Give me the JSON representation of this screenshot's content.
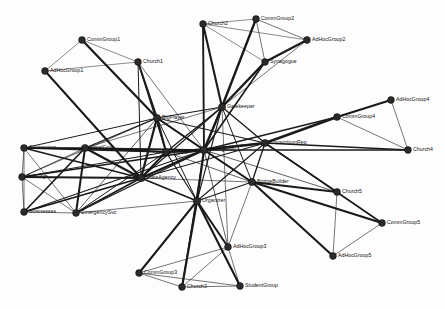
{
  "figure": {
    "width": 445,
    "height": 309,
    "background_color": "#fdfdfd",
    "node_color": "#2b2b2b",
    "edge_color": "#1a1a1a",
    "label_color": "#111111"
  },
  "chart_data": {
    "type": "network",
    "xlabel": "",
    "ylabel": "",
    "grid": false,
    "legend": "none",
    "directed": false,
    "node_count": 28,
    "edge_count": 96,
    "nodes": [
      {
        "id": "CommGroup1",
        "label": "CommGroup1",
        "x": 82,
        "y": 40,
        "r": 3.4,
        "label_dx": 5,
        "label_dy": 0
      },
      {
        "id": "AdHocGroup1",
        "label": "AdHocGroup1",
        "x": 45,
        "y": 71,
        "r": 3.4,
        "label_dx": 5,
        "label_dy": 0
      },
      {
        "id": "Church1",
        "label": "Church1",
        "x": 138,
        "y": 62,
        "r": 3.4,
        "label_dx": 5,
        "label_dy": 0
      },
      {
        "id": "Church2",
        "label": "Church2",
        "x": 203,
        "y": 24,
        "r": 3.4,
        "label_dx": 5,
        "label_dy": 0
      },
      {
        "id": "CommGroup2",
        "label": "CommGroup2",
        "x": 256,
        "y": 19,
        "r": 3.4,
        "label_dx": 5,
        "label_dy": 0
      },
      {
        "id": "AdHocGroup2",
        "label": "AdHocGroup2",
        "x": 307,
        "y": 40,
        "r": 3.4,
        "label_dx": 5,
        "label_dy": 0
      },
      {
        "id": "Synagogue",
        "label": "Synagogue",
        "x": 265,
        "y": 62,
        "r": 3.4,
        "label_dx": 5,
        "label_dy": 0
      },
      {
        "id": "Gatekeeper",
        "label": "Gatekeeper",
        "x": 222,
        "y": 107,
        "r": 3.6,
        "label_dx": 5,
        "label_dy": 0
      },
      {
        "id": "BigPlayer",
        "label": "BigPlayer",
        "x": 157,
        "y": 118,
        "r": 3.6,
        "label_dx": 5,
        "label_dy": 0
      },
      {
        "id": "AdHocGroup4",
        "label": "AdHocGroup4",
        "x": 391,
        "y": 100,
        "r": 3.4,
        "label_dx": 5,
        "label_dy": 0
      },
      {
        "id": "CommGroup4",
        "label": "CommGroup4",
        "x": 337,
        "y": 117,
        "r": 3.4,
        "label_dx": 5,
        "label_dy": 0
      },
      {
        "id": "ConsortiumRep",
        "label": "ConsortiumRep",
        "x": 265,
        "y": 143,
        "r": 3.6,
        "label_dx": 5,
        "label_dy": 0
      },
      {
        "id": "Church4",
        "label": "Church4",
        "x": 408,
        "y": 150,
        "r": 3.4,
        "label_dx": 5,
        "label_dy": 0
      },
      {
        "id": "FedAgency",
        "label": "FedAgency",
        "x": 204,
        "y": 150,
        "r": 3.8,
        "label_dx": 5,
        "label_dy": 0
      },
      {
        "id": "Military",
        "label": "Military",
        "x": 166,
        "y": 152,
        "r": 3.6,
        "label_dx": 5,
        "label_dy": 0
      },
      {
        "id": "Contractors",
        "label": "Contractors",
        "x": 24,
        "y": 148,
        "r": 3.4,
        "label_dx": 5,
        "label_dy": 0
      },
      {
        "id": "LocalGovt",
        "label": "LocalGovt",
        "x": 85,
        "y": 148,
        "r": 3.6,
        "label_dx": 5,
        "label_dy": 0
      },
      {
        "id": "PubOrgs",
        "label": "PubOrgs",
        "x": 22,
        "y": 177,
        "r": 3.4,
        "label_dx": 5,
        "label_dy": 0
      },
      {
        "id": "StateAgency",
        "label": "StateAgency",
        "x": 141,
        "y": 178,
        "r": 3.8,
        "label_dx": 5,
        "label_dy": 0
      },
      {
        "id": "BridgeBuilder",
        "label": "BridgeBuilder",
        "x": 252,
        "y": 182,
        "r": 3.6,
        "label_dx": 5,
        "label_dy": 0
      },
      {
        "id": "Church5",
        "label": "Church5",
        "x": 337,
        "y": 192,
        "r": 3.4,
        "label_dx": 5,
        "label_dy": 0
      },
      {
        "id": "Businesses",
        "label": "Businesses",
        "x": 24,
        "y": 212,
        "r": 3.4,
        "label_dx": 5,
        "label_dy": 0
      },
      {
        "id": "EmergencySvc",
        "label": "EmergencySvc",
        "x": 76,
        "y": 213,
        "r": 3.4,
        "label_dx": 5,
        "label_dy": 0
      },
      {
        "id": "Organizer",
        "label": "Organizer",
        "x": 197,
        "y": 201,
        "r": 3.8,
        "label_dx": 5,
        "label_dy": 0
      },
      {
        "id": "CommGroup5",
        "label": "CommGroup5",
        "x": 382,
        "y": 223,
        "r": 3.4,
        "label_dx": 5,
        "label_dy": 0
      },
      {
        "id": "AdHocGroup3",
        "label": "AdHocGroup3",
        "x": 228,
        "y": 247,
        "r": 3.4,
        "label_dx": 5,
        "label_dy": 0
      },
      {
        "id": "AdHocGroup5",
        "label": "AdHocGroup5",
        "x": 333,
        "y": 256,
        "r": 3.4,
        "label_dx": 5,
        "label_dy": 0
      },
      {
        "id": "CommGroup3",
        "label": "CommGroup3",
        "x": 139,
        "y": 273,
        "r": 3.4,
        "label_dx": 5,
        "label_dy": 0
      },
      {
        "id": "Church3",
        "label": "Church3",
        "x": 182,
        "y": 287,
        "r": 3.4,
        "label_dx": 5,
        "label_dy": 0
      },
      {
        "id": "StudentGroup",
        "label": "StudentGroup",
        "x": 240,
        "y": 286,
        "r": 3.4,
        "label_dx": 5,
        "label_dy": 0
      }
    ],
    "edges": [
      {
        "source": "CommGroup1",
        "target": "AdHocGroup1",
        "weight": 0.5
      },
      {
        "source": "CommGroup1",
        "target": "Church1",
        "weight": 0.5
      },
      {
        "source": "CommGroup1",
        "target": "BigPlayer",
        "weight": 2.2
      },
      {
        "source": "AdHocGroup1",
        "target": "Church1",
        "weight": 0.5
      },
      {
        "source": "AdHocGroup1",
        "target": "StateAgency",
        "weight": 2.0
      },
      {
        "source": "Church1",
        "target": "BigPlayer",
        "weight": 2.0
      },
      {
        "source": "Church1",
        "target": "Military",
        "weight": 1.1
      },
      {
        "source": "Church1",
        "target": "FedAgency",
        "weight": 0.6
      },
      {
        "source": "Church1",
        "target": "StateAgency",
        "weight": 1.0
      },
      {
        "source": "Church2",
        "target": "CommGroup2",
        "weight": 0.5
      },
      {
        "source": "Church2",
        "target": "Synagogue",
        "weight": 0.5
      },
      {
        "source": "Church2",
        "target": "AdHocGroup2",
        "weight": 0.5
      },
      {
        "source": "Church2",
        "target": "Gatekeeper",
        "weight": 2.1
      },
      {
        "source": "Church2",
        "target": "FedAgency",
        "weight": 1.9
      },
      {
        "source": "CommGroup2",
        "target": "Synagogue",
        "weight": 0.6
      },
      {
        "source": "CommGroup2",
        "target": "AdHocGroup2",
        "weight": 0.6
      },
      {
        "source": "CommGroup2",
        "target": "Gatekeeper",
        "weight": 2.3
      },
      {
        "source": "CommGroup2",
        "target": "FedAgency",
        "weight": 0.6
      },
      {
        "source": "AdHocGroup2",
        "target": "Synagogue",
        "weight": 2.2
      },
      {
        "source": "AdHocGroup2",
        "target": "Gatekeeper",
        "weight": 0.6
      },
      {
        "source": "Synagogue",
        "target": "Gatekeeper",
        "weight": 2.4
      },
      {
        "source": "Synagogue",
        "target": "FedAgency",
        "weight": 1.6
      },
      {
        "source": "Gatekeeper",
        "target": "BigPlayer",
        "weight": 1.2
      },
      {
        "source": "Gatekeeper",
        "target": "FedAgency",
        "weight": 2.4
      },
      {
        "source": "Gatekeeper",
        "target": "Military",
        "weight": 1.3
      },
      {
        "source": "Gatekeeper",
        "target": "StateAgency",
        "weight": 1.1
      },
      {
        "source": "Gatekeeper",
        "target": "ConsortiumRep",
        "weight": 1.3
      },
      {
        "source": "Gatekeeper",
        "target": "BridgeBuilder",
        "weight": 1.0
      },
      {
        "source": "Gatekeeper",
        "target": "Organizer",
        "weight": 1.1
      },
      {
        "source": "Gatekeeper",
        "target": "LocalGovt",
        "weight": 0.6
      },
      {
        "source": "Gatekeeper",
        "target": "AdHocGroup3",
        "weight": 0.6
      },
      {
        "source": "BigPlayer",
        "target": "FedAgency",
        "weight": 2.0
      },
      {
        "source": "BigPlayer",
        "target": "Military",
        "weight": 2.1
      },
      {
        "source": "BigPlayer",
        "target": "StateAgency",
        "weight": 2.2
      },
      {
        "source": "BigPlayer",
        "target": "LocalGovt",
        "weight": 1.3
      },
      {
        "source": "BigPlayer",
        "target": "Contractors",
        "weight": 1.0
      },
      {
        "source": "BigPlayer",
        "target": "ConsortiumRep",
        "weight": 1.1
      },
      {
        "source": "BigPlayer",
        "target": "BridgeBuilder",
        "weight": 1.1
      },
      {
        "source": "BigPlayer",
        "target": "Organizer",
        "weight": 1.0
      },
      {
        "source": "BigPlayer",
        "target": "EmergencySvc",
        "weight": 0.7
      },
      {
        "source": "BigPlayer",
        "target": "PubOrgs",
        "weight": 0.7
      },
      {
        "source": "AdHocGroup4",
        "target": "CommGroup4",
        "weight": 2.2
      },
      {
        "source": "AdHocGroup4",
        "target": "Church4",
        "weight": 0.6
      },
      {
        "source": "CommGroup4",
        "target": "Church4",
        "weight": 0.6
      },
      {
        "source": "CommGroup4",
        "target": "ConsortiumRep",
        "weight": 2.6
      },
      {
        "source": "CommGroup4",
        "target": "FedAgency",
        "weight": 1.3
      },
      {
        "source": "Church4",
        "target": "ConsortiumRep",
        "weight": 1.4
      },
      {
        "source": "Church4",
        "target": "FedAgency",
        "weight": 1.6
      },
      {
        "source": "ConsortiumRep",
        "target": "FedAgency",
        "weight": 2.3
      },
      {
        "source": "ConsortiumRep",
        "target": "BridgeBuilder",
        "weight": 1.3
      },
      {
        "source": "ConsortiumRep",
        "target": "Organizer",
        "weight": 1.1
      },
      {
        "source": "ConsortiumRep",
        "target": "StateAgency",
        "weight": 1.1
      },
      {
        "source": "ConsortiumRep",
        "target": "Military",
        "weight": 1.0
      },
      {
        "source": "ConsortiumRep",
        "target": "Church5",
        "weight": 1.5
      },
      {
        "source": "ConsortiumRep",
        "target": "CommGroup5",
        "weight": 1.6
      },
      {
        "source": "FedAgency",
        "target": "Military",
        "weight": 2.6
      },
      {
        "source": "FedAgency",
        "target": "StateAgency",
        "weight": 2.4
      },
      {
        "source": "FedAgency",
        "target": "Organizer",
        "weight": 2.2
      },
      {
        "source": "FedAgency",
        "target": "BridgeBuilder",
        "weight": 1.8
      },
      {
        "source": "FedAgency",
        "target": "LocalGovt",
        "weight": 1.5
      },
      {
        "source": "FedAgency",
        "target": "Contractors",
        "weight": 1.4
      },
      {
        "source": "FedAgency",
        "target": "PubOrgs",
        "weight": 1.4
      },
      {
        "source": "FedAgency",
        "target": "Businesses",
        "weight": 1.2
      },
      {
        "source": "FedAgency",
        "target": "EmergencySvc",
        "weight": 1.3
      },
      {
        "source": "FedAgency",
        "target": "Church5",
        "weight": 0.7
      },
      {
        "source": "FedAgency",
        "target": "AdHocGroup3",
        "weight": 0.7
      },
      {
        "source": "FedAgency",
        "target": "Church3",
        "weight": 1.0
      },
      {
        "source": "Military",
        "target": "StateAgency",
        "weight": 2.0
      },
      {
        "source": "Military",
        "target": "LocalGovt",
        "weight": 1.8
      },
      {
        "source": "Military",
        "target": "Contractors",
        "weight": 1.5
      },
      {
        "source": "Military",
        "target": "Organizer",
        "weight": 1.2
      },
      {
        "source": "Military",
        "target": "PubOrgs",
        "weight": 1.2
      },
      {
        "source": "Military",
        "target": "EmergencySvc",
        "weight": 1.0
      },
      {
        "source": "Military",
        "target": "BridgeBuilder",
        "weight": 0.7
      },
      {
        "source": "Contractors",
        "target": "LocalGovt",
        "weight": 1.5
      },
      {
        "source": "Contractors",
        "target": "PubOrgs",
        "weight": 0.6
      },
      {
        "source": "Contractors",
        "target": "Businesses",
        "weight": 0.6
      },
      {
        "source": "Contractors",
        "target": "StateAgency",
        "weight": 1.6
      },
      {
        "source": "Contractors",
        "target": "EmergencySvc",
        "weight": 0.6
      },
      {
        "source": "LocalGovt",
        "target": "PubOrgs",
        "weight": 0.6
      },
      {
        "source": "LocalGovt",
        "target": "Businesses",
        "weight": 1.7
      },
      {
        "source": "LocalGovt",
        "target": "EmergencySvc",
        "weight": 2.0
      },
      {
        "source": "LocalGovt",
        "target": "StateAgency",
        "weight": 2.2
      },
      {
        "source": "PubOrgs",
        "target": "Businesses",
        "weight": 0.6
      },
      {
        "source": "PubOrgs",
        "target": "EmergencySvc",
        "weight": 0.6
      },
      {
        "source": "PubOrgs",
        "target": "StateAgency",
        "weight": 2.0
      },
      {
        "source": "Businesses",
        "target": "EmergencySvc",
        "weight": 0.6
      },
      {
        "source": "Businesses",
        "target": "StateAgency",
        "weight": 1.8
      },
      {
        "source": "EmergencySvc",
        "target": "StateAgency",
        "weight": 1.8
      },
      {
        "source": "StateAgency",
        "target": "Organizer",
        "weight": 1.8
      },
      {
        "source": "StateAgency",
        "target": "BridgeBuilder",
        "weight": 0.6
      },
      {
        "source": "BridgeBuilder",
        "target": "Organizer",
        "weight": 1.2
      },
      {
        "source": "BridgeBuilder",
        "target": "Church5",
        "weight": 2.0
      },
      {
        "source": "BridgeBuilder",
        "target": "CommGroup5",
        "weight": 2.2
      },
      {
        "source": "BridgeBuilder",
        "target": "AdHocGroup5",
        "weight": 2.1
      },
      {
        "source": "BridgeBuilder",
        "target": "AdHocGroup3",
        "weight": 0.6
      },
      {
        "source": "Church5",
        "target": "CommGroup5",
        "weight": 0.6
      },
      {
        "source": "Church5",
        "target": "AdHocGroup5",
        "weight": 0.6
      },
      {
        "source": "CommGroup5",
        "target": "AdHocGroup5",
        "weight": 0.6
      },
      {
        "source": "Organizer",
        "target": "AdHocGroup3",
        "weight": 2.0
      },
      {
        "source": "Organizer",
        "target": "CommGroup3",
        "weight": 2.0
      },
      {
        "source": "Organizer",
        "target": "Church3",
        "weight": 2.2
      },
      {
        "source": "Organizer",
        "target": "StudentGroup",
        "weight": 2.1
      },
      {
        "source": "Organizer",
        "target": "EmergencySvc",
        "weight": 0.6
      },
      {
        "source": "AdHocGroup3",
        "target": "CommGroup3",
        "weight": 0.6
      },
      {
        "source": "AdHocGroup3",
        "target": "Church3",
        "weight": 0.6
      },
      {
        "source": "AdHocGroup3",
        "target": "StudentGroup",
        "weight": 0.6
      },
      {
        "source": "CommGroup3",
        "target": "Church3",
        "weight": 0.6
      },
      {
        "source": "CommGroup3",
        "target": "StudentGroup",
        "weight": 0.6
      },
      {
        "source": "Church3",
        "target": "StudentGroup",
        "weight": 0.6
      }
    ]
  }
}
